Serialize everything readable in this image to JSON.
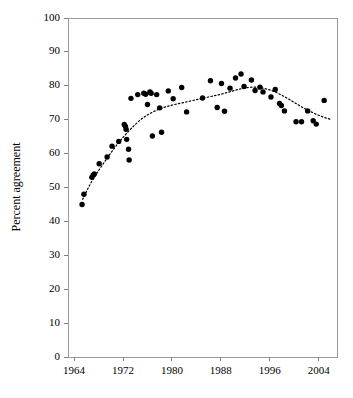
{
  "chart_data": {
    "type": "scatter",
    "title": "",
    "xlabel": "",
    "ylabel": "Percent agreement",
    "xlim": [
      1963,
      2007
    ],
    "ylim": [
      0,
      100
    ],
    "grid": false,
    "legend": "none",
    "xticks": [
      1964,
      1972,
      1980,
      1988,
      1996,
      2004
    ],
    "xtick_labels": [
      "1964",
      "1972",
      "1980",
      "1988",
      "1996",
      "2004"
    ],
    "yticks": [
      0,
      10,
      20,
      30,
      40,
      50,
      60,
      70,
      80,
      90,
      100
    ],
    "ytick_labels": [
      "0",
      "10",
      "20",
      "30",
      "40",
      "50",
      "60",
      "70",
      "80",
      "90",
      "100"
    ],
    "marker": "filled-circle",
    "marker_color": "#000000",
    "trend_line": {
      "style": "dotted",
      "color": "#000000",
      "points": [
        [
          1965.4,
          46.5
        ],
        [
          1966.2,
          49.5
        ],
        [
          1967.0,
          52.2
        ],
        [
          1968.0,
          55.0
        ],
        [
          1969.0,
          57.6
        ],
        [
          1970.0,
          60.2
        ],
        [
          1971.0,
          62.6
        ],
        [
          1972.0,
          64.8
        ],
        [
          1973.0,
          66.8
        ],
        [
          1974.0,
          68.6
        ],
        [
          1975.0,
          70.2
        ],
        [
          1976.0,
          71.4
        ],
        [
          1977.0,
          72.4
        ],
        [
          1978.0,
          73.2
        ],
        [
          1979.0,
          73.8
        ],
        [
          1980.0,
          74.3
        ],
        [
          1981.0,
          74.7
        ],
        [
          1982.0,
          75.1
        ],
        [
          1983.0,
          75.5
        ],
        [
          1984.0,
          75.9
        ],
        [
          1985.0,
          76.3
        ],
        [
          1986.0,
          76.7
        ],
        [
          1987.0,
          77.1
        ],
        [
          1988.0,
          77.5
        ],
        [
          1989.0,
          78.0
        ],
        [
          1990.0,
          78.5
        ],
        [
          1991.0,
          79.0
        ],
        [
          1992.0,
          79.4
        ],
        [
          1993.0,
          79.6
        ],
        [
          1994.0,
          79.6
        ],
        [
          1995.0,
          79.3
        ],
        [
          1996.0,
          78.8
        ],
        [
          1997.0,
          78.1
        ],
        [
          1998.0,
          77.2
        ],
        [
          1999.0,
          76.2
        ],
        [
          2000.0,
          75.1
        ],
        [
          2001.0,
          74.0
        ],
        [
          2002.0,
          73.0
        ],
        [
          2003.0,
          72.1
        ],
        [
          2004.0,
          71.3
        ],
        [
          2005.0,
          70.6
        ],
        [
          2006.0,
          70.1
        ]
      ]
    },
    "points": [
      [
        1965.3,
        45.0
      ],
      [
        1965.6,
        48.0
      ],
      [
        1966.9,
        53.0
      ],
      [
        1967.1,
        53.6
      ],
      [
        1967.3,
        54.0
      ],
      [
        1968.1,
        57.0
      ],
      [
        1969.4,
        59.0
      ],
      [
        1970.2,
        62.2
      ],
      [
        1971.3,
        63.6
      ],
      [
        1972.2,
        68.6
      ],
      [
        1972.4,
        68.0
      ],
      [
        1972.5,
        67.2
      ],
      [
        1972.6,
        64.2
      ],
      [
        1972.9,
        61.3
      ],
      [
        1973.0,
        58.1
      ],
      [
        1973.3,
        76.3
      ],
      [
        1974.4,
        77.4
      ],
      [
        1975.4,
        77.8
      ],
      [
        1975.7,
        77.5
      ],
      [
        1976.0,
        74.5
      ],
      [
        1976.4,
        78.2
      ],
      [
        1976.6,
        77.8
      ],
      [
        1976.8,
        65.2
      ],
      [
        1977.5,
        77.4
      ],
      [
        1978.0,
        73.5
      ],
      [
        1978.3,
        66.3
      ],
      [
        1979.4,
        78.5
      ],
      [
        1980.2,
        76.2
      ],
      [
        1981.6,
        79.5
      ],
      [
        1982.4,
        72.3
      ],
      [
        1985.0,
        76.4
      ],
      [
        1986.3,
        81.5
      ],
      [
        1987.4,
        73.6
      ],
      [
        1988.1,
        80.7
      ],
      [
        1988.6,
        72.5
      ],
      [
        1989.5,
        79.3
      ],
      [
        1990.4,
        82.3
      ],
      [
        1991.3,
        83.5
      ],
      [
        1991.8,
        79.8
      ],
      [
        1993.0,
        81.7
      ],
      [
        1993.6,
        78.6
      ],
      [
        1994.4,
        79.6
      ],
      [
        1994.9,
        78.2
      ],
      [
        1996.2,
        76.7
      ],
      [
        1996.9,
        78.9
      ],
      [
        1997.6,
        74.8
      ],
      [
        1997.9,
        74.2
      ],
      [
        1998.4,
        72.6
      ],
      [
        2000.3,
        69.4
      ],
      [
        2001.2,
        69.4
      ],
      [
        2002.2,
        72.6
      ],
      [
        2003.1,
        69.7
      ],
      [
        2003.6,
        68.7
      ],
      [
        2004.9,
        75.7
      ]
    ]
  }
}
